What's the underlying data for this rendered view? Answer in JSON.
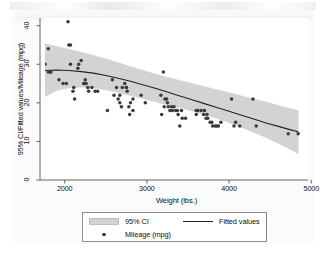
{
  "chart_data": {
    "type": "scatter",
    "title": "",
    "xlabel": "Weight (lbs.)",
    "ylabel": "95% CI/Fitted values/Mileage (mpg)",
    "xlim": [
      1760,
      4960
    ],
    "ylim": [
      0,
      42
    ],
    "xticks": [
      "2000",
      "3000",
      "4000",
      "5000"
    ],
    "xtick_values": [
      2000,
      3000,
      4000,
      5000
    ],
    "yticks": [
      "0",
      "10",
      "20",
      "30",
      "40"
    ],
    "ytick_values": [
      0,
      10,
      20,
      30,
      40
    ],
    "grid": false,
    "legend_position": "below-plot",
    "series": [
      {
        "name": "95% CI",
        "type": "area",
        "color": "#d3d3d3",
        "x": [
          1760,
          1900,
          2050,
          2200,
          2350,
          2500,
          2650,
          2800,
          2950,
          3100,
          3250,
          3400,
          3550,
          3700,
          3850,
          4000,
          4150,
          4300,
          4450,
          4600,
          4750,
          4840
        ],
        "lower": [
          21.6,
          23.2,
          23.9,
          24.1,
          23.9,
          23.4,
          22.7,
          21.9,
          21.1,
          20.3,
          19.5,
          18.7,
          17.9,
          17.0,
          16.0,
          14.9,
          13.7,
          12.4,
          11.0,
          9.5,
          7.9,
          6.9
        ],
        "upper": [
          35.3,
          34.6,
          33.9,
          33.1,
          32.3,
          31.4,
          30.4,
          29.4,
          28.4,
          27.5,
          26.6,
          25.8,
          25.0,
          24.2,
          23.4,
          22.6,
          21.8,
          21.0,
          20.2,
          19.3,
          18.5,
          18.0
        ]
      },
      {
        "name": "Fitted values",
        "type": "line",
        "color": "#222222",
        "x": [
          1760,
          1900,
          2050,
          2200,
          2350,
          2500,
          2650,
          2800,
          2950,
          3100,
          3250,
          3400,
          3550,
          3700,
          3850,
          4000,
          4150,
          4300,
          4450,
          4600,
          4750,
          4840
        ],
        "y": [
          28.4,
          28.5,
          28.4,
          28.1,
          27.7,
          27.1,
          26.4,
          25.6,
          24.7,
          23.8,
          22.8,
          21.8,
          20.8,
          19.8,
          18.8,
          17.8,
          16.8,
          15.8,
          14.8,
          13.9,
          13.0,
          12.5
        ]
      },
      {
        "name": "Mileage (mpg)",
        "type": "scatter",
        "color": "#3a3a3a",
        "points": [
          [
            1760,
            30
          ],
          [
            1800,
            34
          ],
          [
            1830,
            28
          ],
          [
            1800,
            28
          ],
          [
            1830,
            28
          ],
          [
            1930,
            26
          ],
          [
            1980,
            25
          ],
          [
            2020,
            25
          ],
          [
            2040,
            41
          ],
          [
            2050,
            35
          ],
          [
            2070,
            35
          ],
          [
            2070,
            30
          ],
          [
            2100,
            23
          ],
          [
            2110,
            24
          ],
          [
            2120,
            21
          ],
          [
            2160,
            29
          ],
          [
            2170,
            30
          ],
          [
            2200,
            31
          ],
          [
            2230,
            25
          ],
          [
            2240,
            25
          ],
          [
            2250,
            26
          ],
          [
            2260,
            25
          ],
          [
            2280,
            24
          ],
          [
            2290,
            23
          ],
          [
            2330,
            24
          ],
          [
            2370,
            23
          ],
          [
            2400,
            23
          ],
          [
            2520,
            18
          ],
          [
            2580,
            26
          ],
          [
            2600,
            22
          ],
          [
            2630,
            24
          ],
          [
            2650,
            21
          ],
          [
            2670,
            22
          ],
          [
            2670,
            20
          ],
          [
            2690,
            19
          ],
          [
            2700,
            24
          ],
          [
            2730,
            25
          ],
          [
            2750,
            24
          ],
          [
            2750,
            24
          ],
          [
            2760,
            23
          ],
          [
            2780,
            19
          ],
          [
            2790,
            17
          ],
          [
            2800,
            20
          ],
          [
            2830,
            18
          ],
          [
            2830,
            21
          ],
          [
            2930,
            22
          ],
          [
            2980,
            20
          ],
          [
            3170,
            22
          ],
          [
            3180,
            17
          ],
          [
            3200,
            28
          ],
          [
            3210,
            19
          ],
          [
            3220,
            21
          ],
          [
            3240,
            21
          ],
          [
            3250,
            20
          ],
          [
            3260,
            19
          ],
          [
            3280,
            18
          ],
          [
            3300,
            19
          ],
          [
            3310,
            18
          ],
          [
            3330,
            19
          ],
          [
            3350,
            18
          ],
          [
            3360,
            18
          ],
          [
            3370,
            18
          ],
          [
            3380,
            17
          ],
          [
            3400,
            14
          ],
          [
            3420,
            18
          ],
          [
            3430,
            16
          ],
          [
            3470,
            16
          ],
          [
            3600,
            18
          ],
          [
            3600,
            17
          ],
          [
            3620,
            18
          ],
          [
            3660,
            18
          ],
          [
            3690,
            17
          ],
          [
            3700,
            18
          ],
          [
            3720,
            16
          ],
          [
            3730,
            17
          ],
          [
            3740,
            16
          ],
          [
            3770,
            15
          ],
          [
            3790,
            15
          ],
          [
            3800,
            14
          ],
          [
            3830,
            14
          ],
          [
            3850,
            14
          ],
          [
            3870,
            14
          ],
          [
            3900,
            15
          ],
          [
            4030,
            21
          ],
          [
            4060,
            14
          ],
          [
            4080,
            15
          ],
          [
            4130,
            14
          ],
          [
            4290,
            21
          ],
          [
            4330,
            14
          ],
          [
            4720,
            12
          ],
          [
            4840,
            12
          ]
        ]
      }
    ]
  },
  "legend": {
    "items": [
      {
        "label": "95% CI",
        "marker": "area-swatch"
      },
      {
        "label": "Mileage (mpg)",
        "marker": "dot"
      },
      {
        "label": "Fitted values",
        "marker": "line"
      }
    ]
  },
  "axes": {
    "x_title": "Weight (lbs.)",
    "y_title": "95% CI/Fitted values/Mileage (mpg)",
    "x_tick_labels": [
      "2000",
      "3000",
      "4000",
      "5000"
    ],
    "y_tick_labels": [
      "0",
      "10",
      "20",
      "30",
      "40"
    ]
  },
  "colors": {
    "ci_band": "#d3d3d3",
    "fit_line": "#222222",
    "marker": "#3a3a3a",
    "axis": "#555555",
    "text": "#0f0f0f",
    "background": "#ffffff"
  }
}
